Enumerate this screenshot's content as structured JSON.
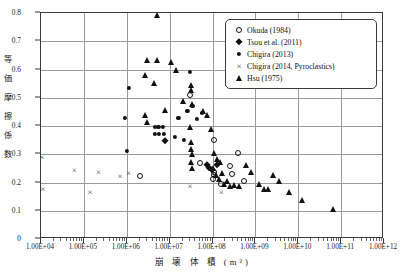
{
  "chart_data": {
    "type": "scatter",
    "title": "",
    "xlabel": "崩 壊 体 積 (m³)",
    "ylabel": "等価摩擦係数",
    "ylabel_chars": [
      "等",
      "価",
      "摩",
      "擦",
      "係",
      "数"
    ],
    "xscale": "log",
    "xlim": [
      10000,
      1000000000000
    ],
    "ylim": [
      0,
      0.8
    ],
    "grid": true,
    "legend_position": "top-right",
    "xticks": [
      "1.00E+04",
      "1.00E+05",
      "1.00E+06",
      "1.00E+07",
      "1.00E+08",
      "1.00E+09",
      "1.00E+10",
      "1.00E+11",
      "1.00E+12"
    ],
    "xtick_values": [
      10000,
      100000,
      1000000,
      10000000,
      100000000,
      1000000000,
      10000000000,
      100000000000,
      1000000000000
    ],
    "yticks": [
      "0",
      "0.1",
      "0.2",
      "0.3",
      "0.4",
      "0.5",
      "0.6",
      "0.7",
      "0.8"
    ],
    "ytick_values": [
      0,
      0.1,
      0.2,
      0.3,
      0.4,
      0.5,
      0.6,
      0.7,
      0.8
    ],
    "series": [
      {
        "name": "Okuda (1984)",
        "marker": "open-circle",
        "points": [
          [
            2000000.0,
            0.222
          ],
          [
            50000000.0,
            0.268
          ],
          [
            110000000.0,
            0.238
          ],
          [
            105000000.0,
            0.213
          ],
          [
            160000000.0,
            0.196
          ],
          [
            30000000.0,
            0.509
          ],
          [
            110000000.0,
            0.352
          ],
          [
            400000000.0,
            0.305
          ],
          [
            260000000.0,
            0.258
          ],
          [
            280000000.0,
            0.229
          ],
          [
            550000000.0,
            0.205
          ],
          [
            110000000.0,
            0.228
          ]
        ]
      },
      {
        "name": "Tsou et al. (2011)",
        "marker": "filled-diamond",
        "points": [
          [
            8000000.0,
            0.348
          ],
          [
            75000000.0,
            0.262
          ],
          [
            82000000.0,
            0.252
          ],
          [
            95000000.0,
            0.243
          ],
          [
            130000000.0,
            0.262
          ]
        ]
      },
      {
        "name": "Chigira (2013)",
        "marker": "small-dot",
        "points": [
          [
            1100000.0,
            0.534
          ],
          [
            900000.0,
            0.428
          ],
          [
            4500000.0,
            0.398
          ],
          [
            5500000.0,
            0.398
          ],
          [
            7000000.0,
            0.398
          ],
          [
            4600000.0,
            0.372
          ],
          [
            5600000.0,
            0.372
          ],
          [
            7200000.0,
            0.372
          ],
          [
            1000000.0,
            0.313
          ],
          [
            16000000.0,
            0.428
          ],
          [
            26000000.0,
            0.452
          ],
          [
            34000000.0,
            0.47
          ],
          [
            44000000.0,
            0.425
          ],
          [
            56000000.0,
            0.445
          ],
          [
            30000000.0,
            0.592
          ],
          [
            22000000.0,
            0.352
          ],
          [
            13000000.0,
            0.362
          ]
        ]
      },
      {
        "name": "Chigira (2014, Pyroclastics)",
        "marker": "cross",
        "points": [
          [
            10500.0,
            0.292
          ],
          [
            11000.0,
            0.176
          ],
          [
            60000.0,
            0.245
          ],
          [
            220000.0,
            0.238
          ],
          [
            140000.0,
            0.166
          ],
          [
            700000.0,
            0.222
          ],
          [
            1100000.0,
            0.232
          ],
          [
            30000000.0,
            0.186
          ],
          [
            160000000.0,
            0.168
          ]
        ]
      },
      {
        "name": "Hsu (1975)",
        "marker": "filled-triangle",
        "points": [
          [
            5000000.0,
            0.793
          ],
          [
            3000000.0,
            0.635
          ],
          [
            5200000.0,
            0.632
          ],
          [
            2700000.0,
            0.58
          ],
          [
            4400000.0,
            0.551
          ],
          [
            2600000.0,
            0.438
          ],
          [
            2900000.0,
            0.415
          ],
          [
            8000000.0,
            0.455
          ],
          [
            11000000.0,
            0.625
          ],
          [
            14000000.0,
            0.6
          ],
          [
            21000000.0,
            0.488
          ],
          [
            31000000.0,
            0.545
          ],
          [
            32000000.0,
            0.527
          ],
          [
            33000000.0,
            0.478
          ],
          [
            30000000.0,
            0.398
          ],
          [
            31000000.0,
            0.345
          ],
          [
            32000000.0,
            0.318
          ],
          [
            33000000.0,
            0.3
          ],
          [
            32000000.0,
            0.272
          ],
          [
            34000000.0,
            0.252
          ],
          [
            60000000.0,
            0.452
          ],
          [
            75000000.0,
            0.438
          ],
          [
            90000000.0,
            0.388
          ],
          [
            110000000.0,
            0.306
          ],
          [
            130000000.0,
            0.283
          ],
          [
            150000000.0,
            0.272
          ],
          [
            100000000.0,
            0.252
          ],
          [
            120000000.0,
            0.228
          ],
          [
            140000000.0,
            0.212
          ],
          [
            170000000.0,
            0.232
          ],
          [
            220000000.0,
            0.205
          ],
          [
            190000000.0,
            0.196
          ],
          [
            260000000.0,
            0.186
          ],
          [
            320000000.0,
            0.19
          ],
          [
            420000000.0,
            0.188
          ],
          [
            600000000.0,
            0.262
          ],
          [
            800000000.0,
            0.238
          ],
          [
            1200000000.0,
            0.196
          ],
          [
            1600000000.0,
            0.178
          ],
          [
            2000000000.0,
            0.176
          ],
          [
            2600000000.0,
            0.225
          ],
          [
            3500000000.0,
            0.207
          ],
          [
            6000000000.0,
            0.166
          ],
          [
            12000000000.0,
            0.138
          ],
          [
            65000000000.0,
            0.106
          ],
          [
            330000000.0,
            0.6
          ],
          [
            440000000.0,
            0.59
          ],
          [
            700000000.0,
            0.602
          ],
          [
            230000000.0,
            0.552
          ]
        ]
      }
    ]
  }
}
